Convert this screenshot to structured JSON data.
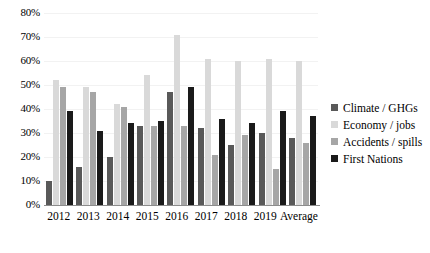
{
  "chart_data": {
    "type": "bar",
    "title": "",
    "xlabel": "",
    "ylabel": "",
    "categories": [
      "2012",
      "2013",
      "2014",
      "2015",
      "2016",
      "2017",
      "2018",
      "2019",
      "Average"
    ],
    "series": [
      {
        "name": "Climate / GHGs",
        "color": "#595959",
        "values": [
          10,
          16,
          20,
          33,
          47,
          32,
          25,
          30,
          28
        ]
      },
      {
        "name": "Economy / jobs",
        "color": "#d9d9d9",
        "values": [
          52,
          49,
          42,
          54,
          71,
          61,
          60,
          61,
          60
        ]
      },
      {
        "name": "Accidents / spills",
        "color": "#a6a6a6",
        "values": [
          49,
          47,
          41,
          33,
          33,
          21,
          29,
          15,
          26
        ]
      },
      {
        "name": "First Nations",
        "color": "#1a1a1a",
        "values": [
          39,
          31,
          34,
          35,
          49,
          36,
          34,
          39,
          37
        ]
      }
    ],
    "ylim": [
      0,
      80
    ],
    "ytick_step": 10,
    "ytick_labels": [
      "0%",
      "10%",
      "20%",
      "30%",
      "40%",
      "50%",
      "60%",
      "70%",
      "80%"
    ],
    "grid": true,
    "legend_position": "right",
    "value_suffix": "%"
  }
}
